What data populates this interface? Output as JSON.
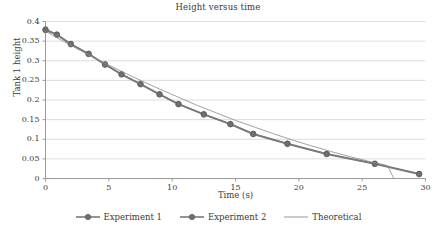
{
  "chart_data": {
    "type": "line",
    "title": "Height versus time",
    "xlabel": "Time (s)",
    "ylabel": "Tank 1 height",
    "xlim": [
      0,
      30
    ],
    "ylim": [
      0,
      0.4
    ],
    "xticks": [
      "0",
      "5",
      "10",
      "15",
      "20",
      "25",
      "30"
    ],
    "xtick_values": [
      0,
      5,
      10,
      15,
      20,
      25,
      30
    ],
    "yticks": [
      "0",
      "0.05",
      "0.1",
      "0.15",
      "0.2",
      "0.25",
      "0.3",
      "0.35",
      "0.4"
    ],
    "ytick_values": [
      0,
      0.05,
      0.1,
      0.15,
      0.2,
      0.25,
      0.3,
      0.35,
      0.4
    ],
    "grid": "horizontal",
    "legend_position": "bottom",
    "series": [
      {
        "name": "Experiment 1",
        "marker": "circle",
        "color": "#6f6f6f",
        "x": [
          0,
          0.9,
          2.0,
          3.4,
          4.7,
          6.0,
          7.5,
          9.0,
          10.5,
          12.5,
          14.6,
          16.4,
          19.1,
          22.2,
          26.0,
          29.5
        ],
        "y": [
          0.38,
          0.367,
          0.343,
          0.318,
          0.291,
          0.266,
          0.241,
          0.215,
          0.19,
          0.164,
          0.139,
          0.114,
          0.089,
          0.063,
          0.038,
          0.012
        ]
      },
      {
        "name": "Experiment 2",
        "marker": "circle",
        "color": "#6f6f6f",
        "x": [
          0,
          0.9,
          2.0,
          3.4,
          4.7,
          6.0,
          7.5,
          9.0,
          10.5,
          12.5,
          14.6,
          16.4,
          19.1,
          22.2,
          26.0,
          29.5
        ],
        "y": [
          0.378,
          0.366,
          0.342,
          0.317,
          0.29,
          0.265,
          0.24,
          0.214,
          0.189,
          0.163,
          0.138,
          0.113,
          0.088,
          0.062,
          0.037,
          0.011
        ]
      },
      {
        "name": "Theoretical",
        "marker": "none",
        "color": "#8a8a8a",
        "x": [
          0,
          1.5,
          3,
          4.5,
          6,
          7.5,
          9,
          10.5,
          12,
          13.5,
          15,
          16.5,
          18,
          19.5,
          21,
          22.5,
          24,
          25.5,
          27,
          27.5
        ],
        "y": [
          0.375,
          0.348,
          0.322,
          0.297,
          0.273,
          0.25,
          0.228,
          0.207,
          0.186,
          0.167,
          0.148,
          0.131,
          0.114,
          0.098,
          0.083,
          0.069,
          0.056,
          0.044,
          0.033,
          0.0
        ]
      }
    ]
  },
  "legend": {
    "items": [
      {
        "label": "Experiment 1",
        "type": "line-marker"
      },
      {
        "label": "Experiment 2",
        "type": "line-marker"
      },
      {
        "label": "Theoretical",
        "type": "line"
      }
    ]
  },
  "colors": {
    "series_dark": "#6f6f6f",
    "series_line": "#7a7a7a",
    "theoretical": "#8a8a8a",
    "grid": "#dcdcdc",
    "axis": "#9a9a9a",
    "text": "#3a3a3a"
  }
}
